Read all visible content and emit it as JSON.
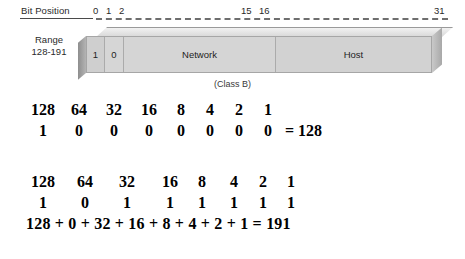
{
  "diagram": {
    "bit_position_label": "Bit Position",
    "ticks": [
      {
        "label": "0",
        "x": 93
      },
      {
        "label": "1",
        "x": 106
      },
      {
        "label": "2",
        "x": 119
      },
      {
        "label": "15",
        "x": 241
      },
      {
        "label": "16",
        "x": 259
      },
      {
        "label": "31",
        "x": 434
      }
    ],
    "range_title": "Range",
    "range_value": "128-191",
    "segments": [
      {
        "name": "bit-1",
        "label": "1"
      },
      {
        "name": "bit-2",
        "label": "0"
      },
      {
        "name": "network",
        "label": "Network"
      },
      {
        "name": "host",
        "label": "Host"
      }
    ],
    "class_caption": "(Class B)"
  },
  "calc1": {
    "place_values": [
      "128",
      "64",
      "32",
      "16",
      "8",
      "4",
      "2",
      "1"
    ],
    "bits": [
      "1",
      "0",
      "0",
      "0",
      "0",
      "0",
      "0",
      "0"
    ],
    "result": "= 128"
  },
  "calc2": {
    "place_values": [
      "128",
      "64",
      "32",
      "16",
      "8",
      "4",
      "2",
      "1"
    ],
    "bits": [
      "1",
      "0",
      "1",
      "1",
      "1",
      "1",
      "1",
      "1"
    ],
    "sum_line": "128 + 0 + 32 + 16 + 8 + 4 + 2 + 1 = 191"
  },
  "colors": {
    "bar_face": "#d3d3d3",
    "bar_edge": "#a6a6a6",
    "ruler": "#6e6e6e",
    "text": "#1a1a1a"
  }
}
